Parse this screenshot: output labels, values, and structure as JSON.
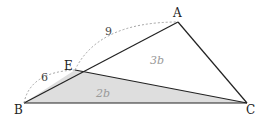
{
  "diagram": {
    "type": "triangle",
    "vertices": {
      "A": {
        "label": "A",
        "x": 178,
        "y": 22
      },
      "B": {
        "label": "B",
        "x": 24,
        "y": 103
      },
      "C": {
        "label": "C",
        "x": 247,
        "y": 103
      },
      "E": {
        "label": "E",
        "x": 75,
        "y": 70
      }
    },
    "segments": {
      "AE": {
        "length_label": "9"
      },
      "EB": {
        "length_label": "6"
      }
    },
    "regions": {
      "EBC": {
        "area_label": "2b",
        "fill": "#dedede"
      },
      "AEC": {
        "area_label": "3b",
        "fill": "#ffffff"
      }
    },
    "colors": {
      "stroke": "#222222",
      "dashed": "#999999",
      "shaded": "#dedede"
    }
  }
}
